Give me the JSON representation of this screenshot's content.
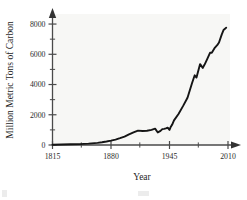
{
  "figure": {
    "name": "global-fossil-fuel-carbon-emissions",
    "background_color": "#ffffff",
    "plot_background_color": "#f7f7f5",
    "line_color": "#151515",
    "axis_color": "#4a4a4a"
  },
  "chart_data": {
    "type": "line",
    "title": "",
    "subtitle": "",
    "xlabel": "Year",
    "ylabel": "Million Metric Tons of Carbon",
    "xlim": [
      1815,
      2010
    ],
    "ylim": [
      0,
      8400
    ],
    "grid": false,
    "legend": null,
    "legend_position": "none",
    "x_major_ticks": [
      1815,
      1880,
      1945,
      2010
    ],
    "x_major_tick_labels": [
      "1815",
      "1880",
      "1945",
      "2010"
    ],
    "x_minor_ticks": [
      1847,
      1912,
      1977
    ],
    "y_major_ticks": [
      0,
      2000,
      4000,
      6000,
      8000
    ],
    "y_major_tick_labels": [
      "0",
      "2000",
      "4000",
      "6000",
      "8000"
    ],
    "y_minor_ticks": [
      1000,
      3000,
      5000,
      7000
    ],
    "axis_arrowheads": true,
    "series": [
      {
        "name": "Global carbon emissions from fossil fuels",
        "x": [
          1815,
          1825,
          1835,
          1845,
          1855,
          1865,
          1870,
          1875,
          1880,
          1885,
          1890,
          1895,
          1900,
          1905,
          1910,
          1915,
          1920,
          1925,
          1929,
          1932,
          1935,
          1937,
          1939,
          1941,
          1943,
          1945,
          1946,
          1948,
          1950,
          1955,
          1960,
          1965,
          1970,
          1973,
          1975,
          1979,
          1982,
          1984,
          1987,
          1990,
          1992,
          1995,
          1998,
          2000,
          2003,
          2005,
          2007,
          2008
        ],
        "y": [
          20,
          30,
          45,
          60,
          90,
          140,
          180,
          230,
          290,
          360,
          450,
          550,
          700,
          830,
          950,
          930,
          940,
          1000,
          1080,
          830,
          930,
          1050,
          1070,
          1100,
          1150,
          1000,
          1150,
          1350,
          1630,
          2050,
          2570,
          3130,
          4080,
          4610,
          4460,
          5350,
          5100,
          5320,
          5700,
          6100,
          6100,
          6400,
          6600,
          6780,
          7300,
          7600,
          7700,
          7760
        ]
      }
    ],
    "annotations": []
  }
}
